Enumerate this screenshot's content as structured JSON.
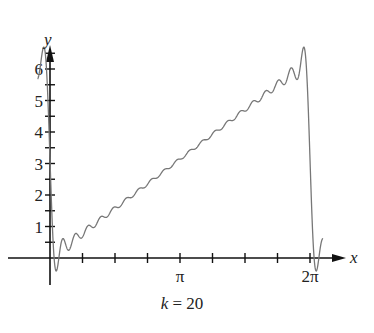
{
  "chart_data": {
    "type": "line",
    "title": "",
    "caption": "k = 20",
    "caption_var": "k",
    "caption_value": "= 20",
    "xlabel": "x",
    "ylabel": "y",
    "x_tick_labels": [
      {
        "value": 3.14159,
        "label": "π"
      },
      {
        "value": 6.28318,
        "label": "2π"
      }
    ],
    "y_tick_labels": [
      1,
      2,
      3,
      4,
      5,
      6
    ],
    "y_minor_step": 0.5,
    "x_minor_step": 0.7854,
    "xlim": [
      -0.3,
      6.9
    ],
    "ylim": [
      -0.6,
      7.0
    ],
    "grid": false,
    "legend": "none",
    "series": [
      {
        "name": "Fourier partial sum, k = 20",
        "description": "Partial Fourier sum of f(x)=x on [0,2π] with 20 terms (Gibbs phenomenon at jumps)",
        "k": 20,
        "x_range": [
          -0.3,
          6.6
        ],
        "color": "#777777"
      }
    ]
  }
}
